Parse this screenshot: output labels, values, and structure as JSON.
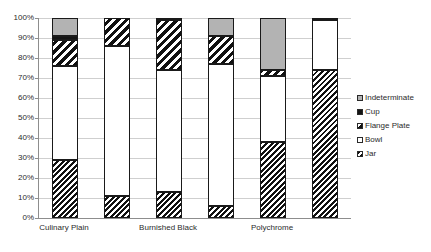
{
  "chart_data": {
    "type": "bar",
    "stacked": true,
    "title": "",
    "xlabel": "",
    "ylabel": "",
    "ylim": [
      0,
      100
    ],
    "grid": true,
    "legend_position": "right",
    "y_ticks": [
      "0%",
      "10%",
      "20%",
      "30%",
      "40%",
      "50%",
      "60%",
      "70%",
      "80%",
      "90%",
      "100%"
    ],
    "y_tick_values": [
      0,
      10,
      20,
      30,
      40,
      50,
      60,
      70,
      80,
      90,
      100
    ],
    "categories": [
      "Culinary Plain",
      "",
      "Burnished Black",
      "",
      "Polychrome",
      ""
    ],
    "visible_category_labels": [
      "Culinary Plain",
      "Burnished Black",
      "Polychrome"
    ],
    "series": [
      {
        "name": "Jar",
        "pattern": "dense-diagonal-hatch",
        "values": [
          29,
          11,
          13,
          6,
          38,
          74
        ]
      },
      {
        "name": "Bowl",
        "pattern": "dotted-stipple",
        "values": [
          47,
          75,
          61,
          71,
          33,
          25
        ]
      },
      {
        "name": "Flange Plate",
        "pattern": "diagonal-hatch",
        "values": [
          13,
          14,
          25,
          14,
          3,
          0
        ]
      },
      {
        "name": "Cup",
        "pattern": "solid-black",
        "values": [
          2,
          0,
          1,
          0,
          0,
          1
        ]
      },
      {
        "name": "Indeterminate",
        "pattern": "solid-gray",
        "values": [
          9,
          0,
          0,
          9,
          26,
          0
        ]
      }
    ],
    "legend_entries": [
      {
        "label": "Indeterminate",
        "pattern": "solid-gray"
      },
      {
        "label": "Cup",
        "pattern": "solid-black"
      },
      {
        "label": "Flange Plate",
        "pattern": "diagonal-hatch"
      },
      {
        "label": "Bowl",
        "pattern": "dotted-stipple"
      },
      {
        "label": "Jar",
        "pattern": "dense-diagonal-hatch"
      }
    ]
  }
}
